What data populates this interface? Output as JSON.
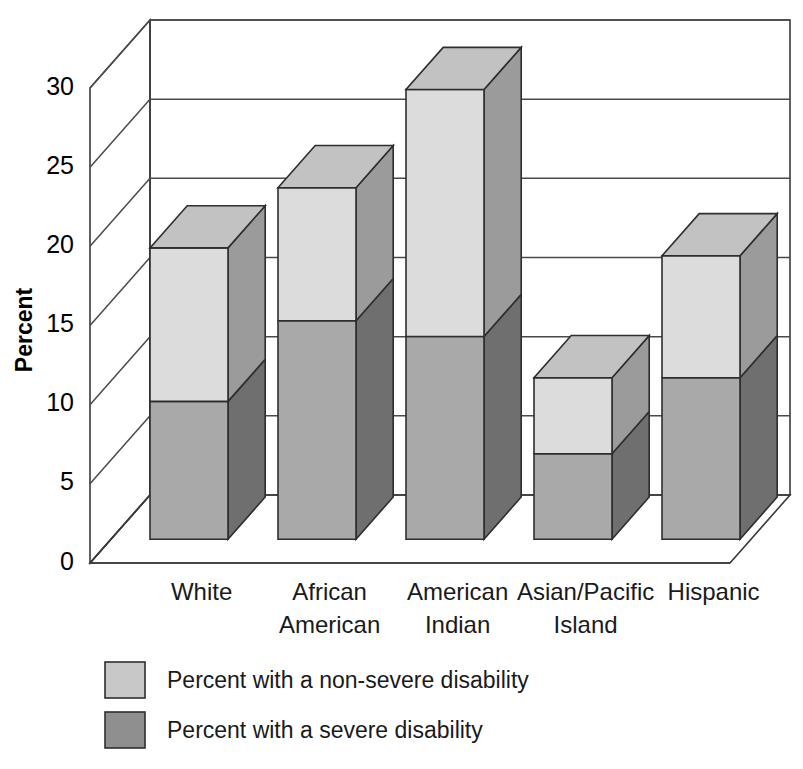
{
  "chart_data": {
    "type": "bar",
    "subtype": "stacked-3d-column",
    "title": "",
    "xlabel": "",
    "ylabel": "Percent",
    "ylim": [
      0,
      30
    ],
    "yticks": [
      0,
      5,
      10,
      15,
      20,
      25,
      30
    ],
    "ytick_labels": [
      "0",
      "5",
      "10",
      "15",
      "20",
      "25",
      "30"
    ],
    "grid": true,
    "legend_position": "bottom-left",
    "categories": [
      "White",
      "African American",
      "American Indian",
      "Asian/Pacific Island",
      "Hispanic"
    ],
    "category_lines": [
      [
        "White"
      ],
      [
        "African",
        "American"
      ],
      [
        "American",
        "Indian"
      ],
      [
        "Asian/Pacific",
        "Island"
      ],
      [
        "Hispanic"
      ]
    ],
    "series": [
      {
        "name": "Percent with a severe disability",
        "color": "#a9a9a9",
        "side_color": "#6f6f6f",
        "values": [
          8.7,
          13.8,
          12.8,
          5.4,
          10.2
        ]
      },
      {
        "name": "Percent with a non-severe disability",
        "color": "#dcdcdc",
        "side_color": "#9b9b9b",
        "values": [
          9.7,
          8.4,
          15.6,
          4.8,
          7.7
        ]
      }
    ],
    "totals": [
      18.4,
      22.2,
      28.4,
      10.2,
      17.9
    ],
    "stack_order": [
      "severe",
      "non-severe"
    ]
  },
  "legend": {
    "items": [
      {
        "label": "Percent with a non-severe disability",
        "swatch": "#c8c8c8"
      },
      {
        "label": "Percent with a severe disability",
        "swatch": "#8f8f8f"
      }
    ]
  },
  "colors": {
    "non_severe_front": "#dcdcdc",
    "non_severe_side": "#9b9b9b",
    "non_severe_top": "#c2c2c2",
    "severe_front": "#a9a9a9",
    "severe_side": "#6f6f6f",
    "frame": "#3a3a3a",
    "background": "#ffffff"
  }
}
